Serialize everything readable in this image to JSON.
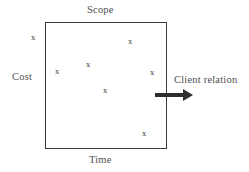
{
  "diagram": {
    "type": "project-constraint-box",
    "labels": {
      "top": "Scope",
      "left": "Cost",
      "bottom": "Time",
      "right_arrow": "Client relation"
    },
    "box": {
      "x": 45,
      "y": 22,
      "width": 122,
      "height": 127,
      "border_color": "#3d3d3d"
    },
    "marks": {
      "glyph": "x",
      "color": "#3a3a3a",
      "points": [
        {
          "id": "mark-1",
          "x": 33,
          "y": 37,
          "inside_box": false
        },
        {
          "id": "mark-2",
          "x": 130,
          "y": 41,
          "inside_box": true
        },
        {
          "id": "mark-3",
          "x": 88,
          "y": 64,
          "inside_box": true
        },
        {
          "id": "mark-4",
          "x": 57,
          "y": 71,
          "inside_box": true
        },
        {
          "id": "mark-5",
          "x": 152,
          "y": 72,
          "inside_box": true
        },
        {
          "id": "mark-6",
          "x": 105,
          "y": 90,
          "inside_box": true
        },
        {
          "id": "mark-7",
          "x": 144,
          "y": 133,
          "inside_box": true
        }
      ]
    },
    "arrow": {
      "direction": "right",
      "x": 155,
      "y": 89,
      "length": 41,
      "color": "#2e2e2e"
    },
    "colors": {
      "background": "#ffffff",
      "text": "#4f4f4f",
      "stroke": "#3d3d3d"
    }
  }
}
